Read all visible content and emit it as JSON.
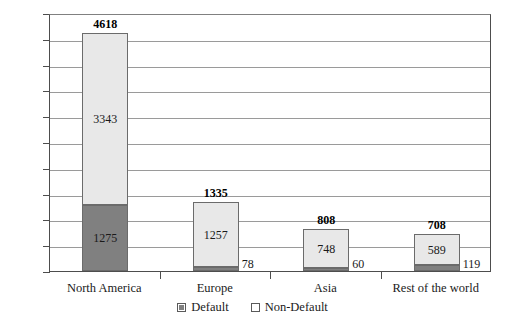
{
  "chart_data": {
    "type": "bar",
    "subtype": "stacked-vertical",
    "title": "",
    "xlabel": "",
    "ylabel": "",
    "ylim": [
      0,
      5000
    ],
    "ytick_step": 500,
    "ytick_labels": [
      "5000",
      "4500",
      "4000",
      "3500",
      "3000",
      "2500",
      "2000",
      "1500",
      "1000",
      "500",
      "0"
    ],
    "ytick_values": [
      5000,
      4500,
      4000,
      3500,
      3000,
      2500,
      2000,
      1500,
      1000,
      500,
      0
    ],
    "grid": true,
    "legend_position": "bottom-center",
    "categories": [
      "North America",
      "Europe",
      "Asia",
      "Rest of the world"
    ],
    "series": [
      {
        "name": "Default",
        "values": [
          1275,
          78,
          60,
          119
        ],
        "color": "#808080"
      },
      {
        "name": "Non-Default",
        "values": [
          3343,
          1257,
          748,
          589
        ],
        "color": "#e8e8e8"
      }
    ],
    "totals": [
      4618,
      1335,
      808,
      708
    ],
    "bars": [
      {
        "category": "North America",
        "total": 4618,
        "total_label": "4618",
        "default_value": 1275,
        "default_label": "1275",
        "default_label_placement": "inside",
        "nondefault_value": 3343,
        "nondefault_label": "3343",
        "nondefault_label_placement": "inside"
      },
      {
        "category": "Europe",
        "total": 1335,
        "total_label": "1335",
        "default_value": 78,
        "default_label": "78",
        "default_label_placement": "outside-right",
        "nondefault_value": 1257,
        "nondefault_label": "1257",
        "nondefault_label_placement": "inside"
      },
      {
        "category": "Asia",
        "total": 808,
        "total_label": "808",
        "default_value": 60,
        "default_label": "60",
        "default_label_placement": "outside-right",
        "nondefault_value": 748,
        "nondefault_label": "748",
        "nondefault_label_placement": "inside"
      },
      {
        "category": "Rest of the world",
        "total": 708,
        "total_label": "708",
        "default_value": 119,
        "default_label": "119",
        "default_label_placement": "outside-right",
        "nondefault_value": 589,
        "nondefault_label": "589",
        "nondefault_label_placement": "inside"
      }
    ]
  },
  "legend": {
    "items": [
      {
        "label": "Default",
        "swatch": "default"
      },
      {
        "label": "Non-Default",
        "swatch": "nondefault"
      }
    ]
  },
  "colors": {
    "default_fill": "#808080",
    "nondefault_fill": "#e8e8e8",
    "bar_border": "#6b6b6b",
    "gridline": "#9a9a9a",
    "axis": "#4d4d4d",
    "background": "#ffffff",
    "text": "#1a1a1a"
  }
}
